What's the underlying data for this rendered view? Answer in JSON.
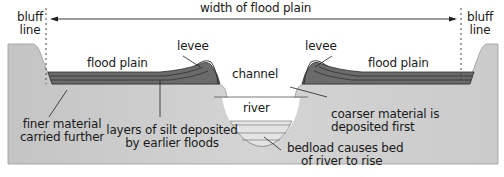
{
  "colors": {
    "ground": "#cfcfcf",
    "ground_dark": "#bdbdbd",
    "silt": "#6e6e6e",
    "silt_line": "#2e2e2e",
    "water": "#ffffff",
    "bedload": "#e2e2e2",
    "line": "#222222"
  },
  "labels": {
    "bluff_left": [
      "bluff",
      "line"
    ],
    "bluff_right": [
      "bluff",
      "line"
    ],
    "width": "width of flood plain",
    "flood_plain_left": "flood plain",
    "flood_plain_right": "flood plain",
    "levee_left": "levee",
    "levee_right": "levee",
    "channel": "channel",
    "river": "river",
    "finer_material": [
      "finer material",
      "carried further"
    ],
    "layers_of_silt": [
      "layers of silt deposited",
      "by earlier floods"
    ],
    "coarser_material": [
      "coarser material is",
      "deposited first"
    ],
    "bedload": [
      "bedload causes bed",
      "of river to rise"
    ]
  }
}
